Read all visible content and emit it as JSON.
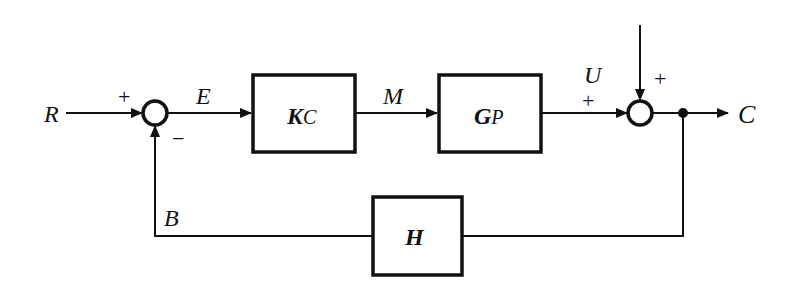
{
  "diagram": {
    "title": "",
    "type": "feedback-control-block-diagram",
    "signals": {
      "reference": "R",
      "error": "E",
      "manipulated": "M",
      "disturbance": "U",
      "output": "C",
      "feedback": "B"
    },
    "blocks": {
      "controller": {
        "main": "K",
        "sub": "C"
      },
      "process": {
        "main": "G",
        "sub": "P"
      },
      "feedback": {
        "main": "H"
      }
    },
    "summing_junction_1": {
      "plus": "+",
      "minus": "−"
    },
    "summing_junction_2": {
      "plus_left": "+",
      "plus_top": "+"
    },
    "colors": {
      "line": "#111111",
      "background": "#ffffff"
    }
  }
}
